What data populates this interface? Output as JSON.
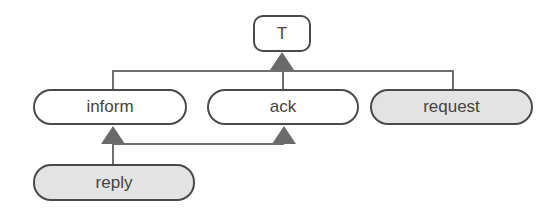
{
  "diagram": {
    "type": "inheritance-tree",
    "colors": {
      "border": "#4a4a4a",
      "line": "#6e6e6e",
      "arrow": "#6a6a6a",
      "plain_fill": "#ffffff",
      "shaded_fill": "#e3e3e3",
      "text": "#444444"
    },
    "nodes": {
      "root": {
        "label": "T",
        "fill": "plain"
      },
      "inform": {
        "label": "inform",
        "fill": "plain"
      },
      "ack": {
        "label": "ack",
        "fill": "plain"
      },
      "request": {
        "label": "request",
        "fill": "shaded"
      },
      "reply": {
        "label": "reply",
        "fill": "shaded"
      }
    },
    "edges": [
      {
        "from": "inform",
        "to": "T",
        "style": "triangle-arrow"
      },
      {
        "from": "ack",
        "to": "T",
        "style": "triangle-arrow"
      },
      {
        "from": "request",
        "to": "T",
        "style": "triangle-arrow"
      },
      {
        "from": "reply",
        "to": "inform",
        "style": "triangle-arrow"
      },
      {
        "from": "reply",
        "to": "ack",
        "style": "triangle-arrow"
      }
    ]
  }
}
